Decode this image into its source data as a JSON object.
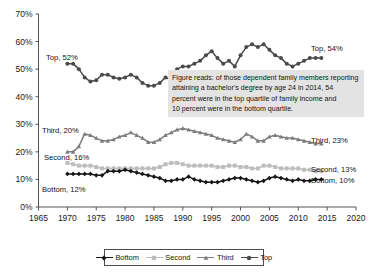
{
  "chart_data": {
    "type": "line",
    "title": "",
    "xlabel": "",
    "ylabel": "",
    "xlim": [
      1965,
      2020
    ],
    "ylim": [
      0,
      70
    ],
    "xticks": [
      1965,
      1970,
      1975,
      1980,
      1985,
      1990,
      1995,
      2000,
      2005,
      2010,
      2015,
      2020
    ],
    "yticks": [
      "0%",
      "10%",
      "20%",
      "30%",
      "40%",
      "50%",
      "60%",
      "70%"
    ],
    "ytick_values": [
      0,
      10,
      20,
      30,
      40,
      50,
      60,
      70
    ],
    "grid": false,
    "legend_position": "bottom",
    "x": [
      1970,
      1971,
      1972,
      1973,
      1974,
      1975,
      1976,
      1977,
      1978,
      1979,
      1980,
      1981,
      1982,
      1983,
      1984,
      1985,
      1986,
      1987,
      1988,
      1989,
      1990,
      1991,
      1992,
      1993,
      1994,
      1995,
      1996,
      1997,
      1998,
      1999,
      2000,
      2001,
      2002,
      2003,
      2004,
      2005,
      2006,
      2007,
      2008,
      2009,
      2010,
      2011,
      2012,
      2013,
      2014
    ],
    "series": [
      {
        "name": "Top",
        "color": "#4a4a4a",
        "marker": "circle",
        "start_label": "Top, 52%",
        "end_label": "Top, 54%",
        "values": [
          52,
          52,
          50,
          47,
          45.5,
          46,
          48,
          48,
          47,
          46.5,
          47,
          48,
          47,
          45,
          44,
          44,
          45,
          47,
          46,
          50,
          51,
          51,
          52,
          53,
          55,
          56.5,
          54,
          52,
          53,
          51,
          55,
          58,
          59,
          58,
          59,
          57,
          55,
          54,
          52,
          51,
          52,
          53,
          54,
          54,
          54
        ]
      },
      {
        "name": "Third",
        "color": "#7d7d7d",
        "marker": "triangle",
        "start_label": "Third, 20%",
        "end_label": "Third, 23%",
        "values": [
          20,
          20,
          22,
          26.5,
          26,
          25,
          24,
          24,
          24.5,
          25.5,
          26,
          27,
          26,
          25,
          23.5,
          23.5,
          24.5,
          26,
          27,
          28,
          28.5,
          28,
          27.5,
          27,
          26.5,
          26,
          25,
          24.5,
          24,
          23.5,
          24.5,
          26.5,
          25.5,
          24,
          24,
          25.5,
          26,
          25.5,
          25,
          25,
          24.5,
          24,
          23.5,
          23,
          23
        ]
      },
      {
        "name": "Second",
        "color": "#bdbdbd",
        "marker": "square",
        "start_label": "Second, 16%",
        "end_label": "Second, 13%",
        "values": [
          16,
          15.5,
          15,
          15,
          15,
          14.5,
          14,
          14,
          14,
          14,
          14,
          14,
          14,
          14,
          14,
          14,
          14.5,
          15.5,
          16,
          16,
          15.5,
          15,
          15,
          15,
          15,
          15,
          14.5,
          14.5,
          15,
          15,
          14.5,
          14.5,
          14,
          14,
          15,
          15,
          14.5,
          14,
          14,
          14,
          14,
          13.5,
          13.5,
          13,
          13
        ]
      },
      {
        "name": "Bottom",
        "color": "#171717",
        "marker": "diamond",
        "start_label": "Bottom, 12%",
        "end_label": "Bottom, 10%",
        "values": [
          12,
          12,
          12,
          12,
          12,
          11.5,
          11.5,
          13,
          13,
          13,
          13.5,
          13,
          12.5,
          12,
          11.5,
          11,
          10.5,
          9.5,
          9.5,
          10,
          10,
          11,
          10,
          9.5,
          9,
          9,
          9,
          9.5,
          10,
          10.5,
          10.5,
          10,
          9.5,
          9,
          9.5,
          10.5,
          11,
          10.5,
          10,
          9.5,
          10,
          9.5,
          9.5,
          10,
          10
        ]
      }
    ]
  },
  "callout": {
    "lines": [
      "Figure reads: of those dependent family members reporting",
      "attaining a bachelor's degree by age 24 in 2014, 54",
      "percent were in the top quartile of family income and",
      "10 percent were in the bottom quartile."
    ]
  },
  "legend": {
    "items": [
      {
        "label": "Bottom",
        "color": "#171717",
        "marker": "diamond"
      },
      {
        "label": "Second",
        "color": "#bdbdbd",
        "marker": "square"
      },
      {
        "label": "Third",
        "color": "#7d7d7d",
        "marker": "triangle"
      },
      {
        "label": "Top",
        "color": "#4a4a4a",
        "marker": "circle"
      }
    ]
  },
  "axis": {
    "line_color": "#555555",
    "background": "#ffffff"
  }
}
